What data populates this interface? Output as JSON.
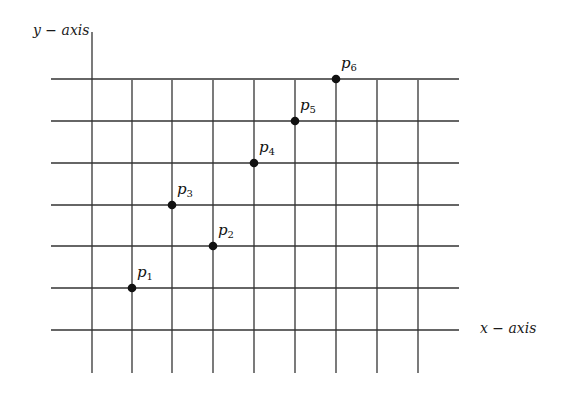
{
  "diagram": {
    "type": "grid-with-points",
    "y_axis_label": "y − axis",
    "x_axis_label": "x − axis",
    "line_color": "#333333",
    "point_color": "#111111",
    "grid": {
      "vertical_x": [
        92,
        132,
        172,
        213,
        254,
        295,
        336,
        377,
        418
      ],
      "vertical_y_top": 80,
      "vertical_y_bottom": 373,
      "axis_x": 92,
      "axis_y_top": 32,
      "horizontal_y": [
        79,
        121,
        163,
        205,
        246,
        288,
        330
      ],
      "horizontal_x_left": 51,
      "horizontal_x_right": 459
    },
    "points": [
      {
        "name": "p",
        "sub": "1",
        "grid_col": 1,
        "grid_row": 1,
        "x": 132,
        "y": 288
      },
      {
        "name": "p",
        "sub": "2",
        "grid_col": 3,
        "grid_row": 2,
        "x": 213,
        "y": 246
      },
      {
        "name": "p",
        "sub": "3",
        "grid_col": 2,
        "grid_row": 3,
        "x": 172,
        "y": 205
      },
      {
        "name": "p",
        "sub": "4",
        "grid_col": 4,
        "grid_row": 4,
        "x": 254,
        "y": 163
      },
      {
        "name": "p",
        "sub": "5",
        "grid_col": 5,
        "grid_row": 5,
        "x": 295,
        "y": 121
      },
      {
        "name": "p",
        "sub": "6",
        "grid_col": 6,
        "grid_row": 6,
        "x": 336,
        "y": 79
      }
    ]
  }
}
